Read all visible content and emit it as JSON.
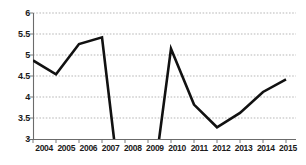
{
  "chart_data": {
    "type": "line",
    "title": "",
    "subtitle": "",
    "xlabel": "",
    "ylabel": "",
    "categories": [
      "2004",
      "2005",
      "2006",
      "2007",
      "2008",
      "2009",
      "2010",
      "2011",
      "2012",
      "2013",
      "2014",
      "2015"
    ],
    "series": [
      {
        "name": "",
        "values": [
          4.87,
          4.54,
          5.26,
          5.42,
          null,
          null,
          5.15,
          3.82,
          3.28,
          3.62,
          4.12,
          4.42
        ],
        "color": "#111111",
        "note": "Values for 2008 and 2009 fall below the displayed y-axis minimum of 3 and are clipped; the line runs off the bottom of the plot between 2007 and 2010."
      }
    ],
    "ylim": [
      3,
      6
    ],
    "yticks": [
      "3",
      "3.5",
      "4",
      "4.5",
      "5",
      "5.5",
      "6"
    ],
    "ytick_values": [
      3,
      3.5,
      4,
      4.5,
      5,
      5.5,
      6
    ],
    "xlim": [
      "2004",
      "2015"
    ],
    "grid": true,
    "grid_axis": "y",
    "grid_style": "dashed",
    "legend": false,
    "legend_position": "none",
    "annotations": []
  },
  "axes": {
    "y_axis_name": "y-axis",
    "x_axis_name": "x-axis"
  },
  "colors": {
    "series": "#111111",
    "grid": "#9a9a9a",
    "axis": "#6b6b6b",
    "background": "#ffffff",
    "text": "#1a1a1a"
  }
}
